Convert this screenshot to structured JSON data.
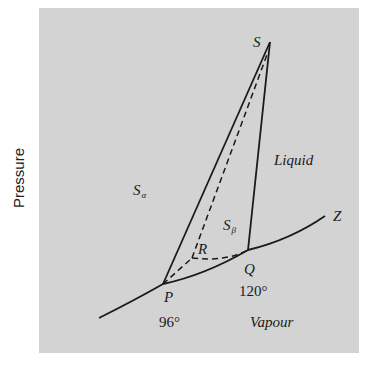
{
  "diagram": {
    "type": "phase-diagram",
    "axis": {
      "y_label": "Pressure"
    },
    "regions": {
      "s_alpha": {
        "main": "S",
        "sub": "α"
      },
      "s_beta": {
        "main": "S",
        "sub": "β"
      },
      "liquid": "Liquid",
      "vapour": "Vapour"
    },
    "points": {
      "S": "S",
      "P": "P",
      "Q": "Q",
      "R": "R",
      "Z": "Z"
    },
    "temperatures": {
      "P": "96°",
      "Q": "120°"
    },
    "colors": {
      "background": "#d3d3d3",
      "line": "#1a1a1a"
    }
  }
}
